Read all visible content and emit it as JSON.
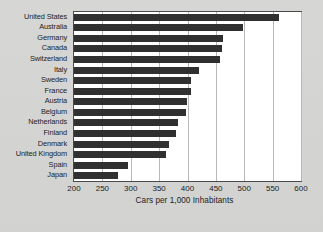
{
  "chart_data": {
    "type": "bar",
    "orientation": "horizontal",
    "title": "",
    "subtitle": "",
    "xlabel": "Cars per 1,000 Inhabitants",
    "ylabel": "",
    "xlim": [
      200,
      600
    ],
    "ylim": null,
    "grid": true,
    "legend": null,
    "xticks": [
      200,
      250,
      300,
      350,
      400,
      450,
      500,
      550,
      600
    ],
    "xtick_labels": [
      "200",
      "250",
      "300",
      "350",
      "400",
      "450",
      "500",
      "550",
      "600"
    ],
    "categories": [
      "United States",
      "Australia",
      "Germany",
      "Canada",
      "Switzerland",
      "Italy",
      "Sweden",
      "France",
      "Austria",
      "Belgium",
      "Netherlands",
      "Finland",
      "Denmark",
      "United Kingdom",
      "Spain",
      "Japan"
    ],
    "values": [
      562,
      498,
      462,
      460,
      458,
      421,
      407,
      406,
      399,
      398,
      383,
      380,
      368,
      362,
      296,
      277
    ],
    "bar_color": "#303030",
    "plot_background": "#ffffff",
    "figure_background": "#d4d4d2",
    "grid_color": "#b8b8b8",
    "axis_color": "#4a4a4a"
  }
}
